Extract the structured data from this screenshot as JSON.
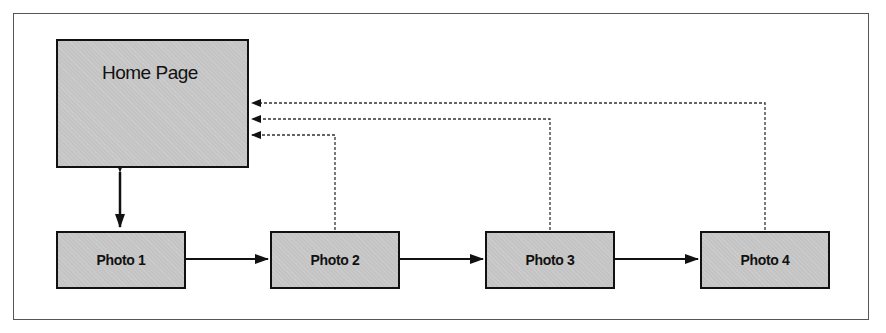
{
  "diagram": {
    "nodes": [
      {
        "id": "home",
        "label": "Home Page"
      },
      {
        "id": "photo1",
        "label": "Photo 1"
      },
      {
        "id": "photo2",
        "label": "Photo 2"
      },
      {
        "id": "photo3",
        "label": "Photo 3"
      },
      {
        "id": "photo4",
        "label": "Photo 4"
      }
    ],
    "edges": [
      {
        "from": "home",
        "to": "photo1",
        "style": "solid",
        "direction": "both"
      },
      {
        "from": "photo1",
        "to": "photo2",
        "style": "solid",
        "direction": "forward"
      },
      {
        "from": "photo2",
        "to": "photo3",
        "style": "solid",
        "direction": "forward"
      },
      {
        "from": "photo3",
        "to": "photo4",
        "style": "solid",
        "direction": "forward"
      },
      {
        "from": "photo2",
        "to": "home",
        "style": "dotted",
        "direction": "forward"
      },
      {
        "from": "photo3",
        "to": "home",
        "style": "dotted",
        "direction": "forward"
      },
      {
        "from": "photo4",
        "to": "home",
        "style": "dotted",
        "direction": "forward"
      }
    ],
    "colors": {
      "node_fill": "#c4c4c4",
      "stroke": "#111111",
      "frame": "#555555"
    }
  }
}
